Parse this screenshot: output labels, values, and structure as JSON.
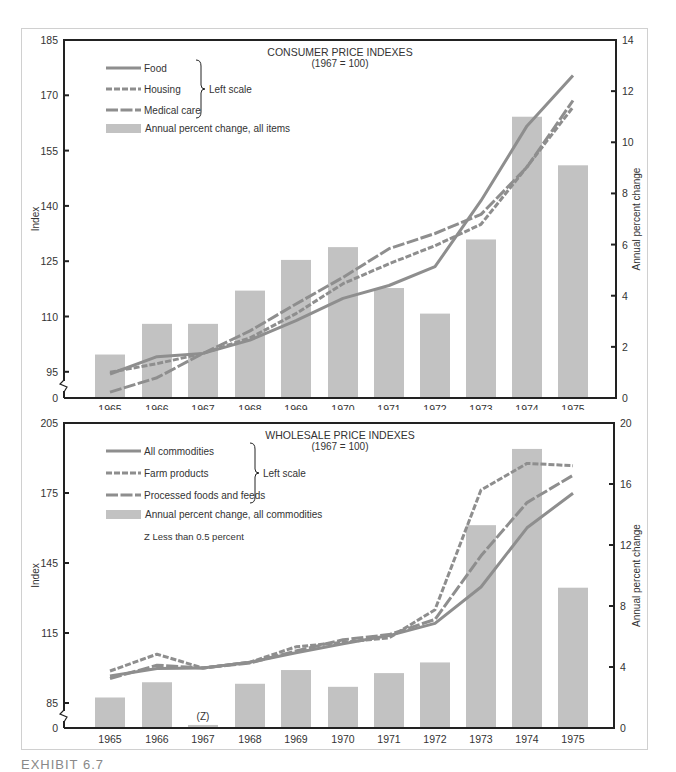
{
  "exhibit_label": "EXHIBIT 6.7",
  "colors": {
    "bar": "#c2c2c2",
    "line": "#8e8e8e",
    "axis": "#222222",
    "text": "#333333",
    "frame": "#d0d0d0"
  },
  "chart_data": [
    {
      "type": "bar+line",
      "title": "CONSUMER PRICE INDEXES",
      "subtitle": "(1967 = 100)",
      "categories": [
        "1965",
        "1966",
        "1967",
        "1968",
        "1969",
        "1970",
        "1971",
        "1972",
        "1973",
        "1974",
        "1975"
      ],
      "ylabel": "Index",
      "y2label": "Annual percent change",
      "left_ticks": [
        "185",
        "170",
        "155",
        "140",
        "125",
        "110",
        "95",
        "0"
      ],
      "left_tick_values": [
        185,
        170,
        155,
        140,
        125,
        110,
        95
      ],
      "right_ticks": [
        "14",
        "12",
        "10",
        "8",
        "6",
        "4",
        "2",
        "0"
      ],
      "ylim": [
        85,
        185
      ],
      "y2lim": [
        0,
        14
      ],
      "axis_break": true,
      "legend_bracket_label": "Left scale",
      "series": [
        {
          "name": "Food",
          "style": "solid",
          "axis": "left",
          "values": [
            94.4,
            99.1,
            100,
            103.6,
            108.9,
            114.9,
            118.4,
            123.5,
            141.4,
            161.7,
            175.4
          ]
        },
        {
          "name": "Housing",
          "style": "short-dash",
          "axis": "left",
          "values": [
            94.9,
            97.2,
            100,
            104.2,
            110.8,
            118.9,
            124.3,
            129.2,
            135.0,
            150.6,
            166.8
          ]
        },
        {
          "name": "Medical care",
          "style": "long-dash",
          "axis": "left",
          "values": [
            89.5,
            93.4,
            100,
            106.1,
            113.4,
            120.6,
            128.4,
            132.5,
            137.7,
            150.5,
            168.6
          ]
        },
        {
          "name": "Annual percent change, all items",
          "style": "bar",
          "axis": "right",
          "values": [
            1.7,
            2.9,
            2.9,
            4.2,
            5.4,
            5.9,
            4.3,
            3.3,
            6.2,
            11.0,
            9.1
          ]
        }
      ]
    },
    {
      "type": "bar+line",
      "title": "WHOLESALE PRICE INDEXES",
      "subtitle": "(1967 = 100)",
      "categories": [
        "1965",
        "1966",
        "1967",
        "1968",
        "1969",
        "1970",
        "1971",
        "1972",
        "1973",
        "1974",
        "1975"
      ],
      "ylabel": "Index",
      "y2label": "Annual percent change",
      "left_ticks": [
        "205",
        "175",
        "145",
        "115",
        "85",
        "0"
      ],
      "left_tick_values": [
        205,
        175,
        145,
        115,
        85
      ],
      "right_ticks": [
        "20",
        "16",
        "12",
        "8",
        "4",
        "0"
      ],
      "ylim": [
        75,
        205
      ],
      "y2lim": [
        0,
        20
      ],
      "axis_break": true,
      "legend_bracket_label": "Left scale",
      "note": "Z Less than 0.5 percent",
      "bar_annotations": {
        "1967": "(Z)"
      },
      "series": [
        {
          "name": "All commodities",
          "style": "solid",
          "axis": "left",
          "values": [
            96.6,
            99.8,
            100,
            102.5,
            106.5,
            110.4,
            113.9,
            119.1,
            134.7,
            160.1,
            174.9
          ]
        },
        {
          "name": "Farm products",
          "style": "short-dash",
          "axis": "left",
          "values": [
            98.7,
            105.9,
            100,
            102.5,
            109.1,
            111.0,
            112.9,
            125.0,
            176.3,
            187.7,
            186.7
          ]
        },
        {
          "name": "Processed foods and feeds",
          "style": "long-dash",
          "axis": "left",
          "values": [
            95.5,
            101.2,
            100,
            102.2,
            107.3,
            112.1,
            114.3,
            120.8,
            148.1,
            170.9,
            182.6
          ]
        },
        {
          "name": "Annual percent change, all commodities",
          "style": "bar",
          "axis": "right",
          "values": [
            2.0,
            3.0,
            0.2,
            2.9,
            3.8,
            2.7,
            3.6,
            4.3,
            13.3,
            18.3,
            9.2
          ]
        }
      ]
    }
  ]
}
